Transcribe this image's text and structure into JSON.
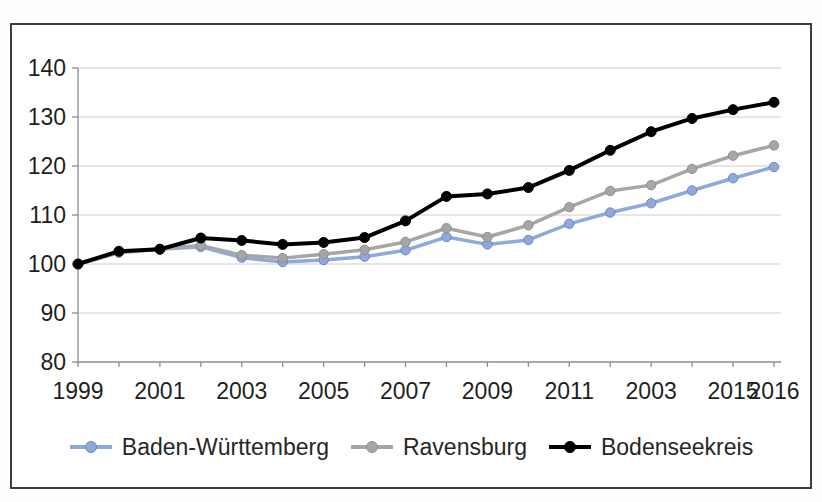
{
  "chart_data": {
    "type": "line",
    "title": "",
    "grid": true,
    "legend_position": "bottom",
    "x": [
      1999,
      2000,
      2001,
      2002,
      2003,
      2004,
      2005,
      2006,
      2007,
      2008,
      2009,
      2010,
      2011,
      2012,
      2013,
      2014,
      2015,
      2016
    ],
    "x_axis": {
      "min": 1999,
      "max": 2016,
      "tick_labels": [
        {
          "value": 1999,
          "label": "1999"
        },
        {
          "value": 2001,
          "label": "2001"
        },
        {
          "value": 2003,
          "label": "2003"
        },
        {
          "value": 2005,
          "label": "2005"
        },
        {
          "value": 2007,
          "label": "2007"
        },
        {
          "value": 2009,
          "label": "2009"
        },
        {
          "value": 2011,
          "label": "2011"
        },
        {
          "value": 2013,
          "label": "2003"
        },
        {
          "value": 2015,
          "label": "2015"
        },
        {
          "value": 2016,
          "label": "2016"
        }
      ]
    },
    "y_axis": {
      "min": 80,
      "max": 140,
      "tick_values": [
        140,
        130,
        120,
        110,
        100,
        90,
        80
      ]
    },
    "series": [
      {
        "name": "Baden-Württemberg",
        "color": "#8ea9db",
        "marker_stroke": "#7287b9",
        "values": [
          100,
          102.3,
          103,
          103.5,
          101.3,
          100.4,
          100.8,
          101.5,
          102.8,
          105.5,
          104,
          104.9,
          108.2,
          110.5,
          112.4,
          115,
          117.5,
          119.8
        ]
      },
      {
        "name": "Ravensburg",
        "color": "#a6a6a6",
        "marker_stroke": "#8f8f8f",
        "values": [
          100,
          102.4,
          103.1,
          103.8,
          101.8,
          101.2,
          102,
          102.9,
          104.5,
          107.3,
          105.5,
          107.9,
          111.6,
          114.9,
          116.1,
          119.4,
          122.1,
          124.2
        ]
      },
      {
        "name": "Bodenseekreis",
        "color": "#000000",
        "marker_stroke": "#000000",
        "values": [
          100,
          102.6,
          103,
          105.3,
          104.8,
          104,
          104.4,
          105.4,
          108.8,
          113.8,
          114.3,
          115.6,
          119.1,
          123.2,
          127,
          129.7,
          131.5,
          133
        ]
      }
    ],
    "colors": {
      "gridline": "#cccccc",
      "axis_line": "#8c8c8c",
      "tick_text": "#1f1f1f",
      "frame_border": "#3d3d3d"
    }
  }
}
